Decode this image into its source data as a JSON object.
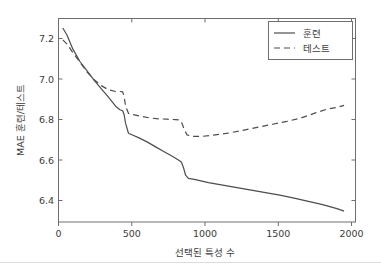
{
  "chart_data": {
    "type": "line",
    "title": "",
    "xlabel": "선택된 특성 수",
    "ylabel": "MAE 훈련/테스트",
    "xlim": [
      0,
      2080
    ],
    "ylim": [
      6.31,
      7.28
    ],
    "grid": false,
    "legend_position": "top-right",
    "xticks": [
      0,
      500,
      1000,
      1500,
      2000
    ],
    "xticklabels": [
      "0",
      "500",
      "1000",
      "1500",
      "2000"
    ],
    "yticks": [
      6.4,
      6.6,
      6.8,
      7.0,
      7.2
    ],
    "yticklabels": [
      "6.4",
      "6.6",
      "6.8",
      "7.0",
      "7.2"
    ],
    "series": [
      {
        "name": "훈련",
        "style": "solid",
        "color": "#4d4d4d",
        "x": [
          30,
          60,
          100,
          150,
          200,
          250,
          300,
          350,
          400,
          430,
          450,
          460,
          470,
          490,
          510,
          560,
          620,
          680,
          740,
          800,
          840,
          860,
          875,
          890,
          910,
          960,
          1050,
          1150,
          1250,
          1350,
          1450,
          1550,
          1650,
          1750,
          1850,
          1950,
          2000
        ],
        "values": [
          7.235,
          7.2,
          7.135,
          7.075,
          7.03,
          6.985,
          6.945,
          6.905,
          6.862,
          6.845,
          6.84,
          6.82,
          6.78,
          6.733,
          6.727,
          6.712,
          6.692,
          6.668,
          6.645,
          6.622,
          6.606,
          6.596,
          6.57,
          6.533,
          6.518,
          6.512,
          6.498,
          6.486,
          6.474,
          6.462,
          6.45,
          6.438,
          6.424,
          6.408,
          6.393,
          6.374,
          6.362
        ]
      },
      {
        "name": "테스트",
        "style": "dashed",
        "color": "#4d4d4d",
        "x": [
          30,
          60,
          100,
          150,
          200,
          250,
          300,
          350,
          400,
          430,
          450,
          460,
          470,
          490,
          520,
          570,
          640,
          700,
          760,
          820,
          850,
          865,
          880,
          900,
          940,
          1000,
          1060,
          1130,
          1200,
          1300,
          1400,
          1500,
          1600,
          1700,
          1800,
          1880,
          1950,
          2000
        ],
        "values": [
          7.178,
          7.158,
          7.118,
          7.072,
          7.025,
          6.988,
          6.96,
          6.94,
          6.932,
          6.932,
          6.93,
          6.905,
          6.862,
          6.828,
          6.822,
          6.815,
          6.806,
          6.802,
          6.8,
          6.798,
          6.796,
          6.78,
          6.752,
          6.725,
          6.718,
          6.718,
          6.722,
          6.728,
          6.735,
          6.748,
          6.762,
          6.776,
          6.79,
          6.806,
          6.83,
          6.848,
          6.856,
          6.866
        ]
      }
    ]
  },
  "legend": {
    "entries": [
      {
        "label": "훈련",
        "style": "solid"
      },
      {
        "label": "테스트",
        "style": "dashed"
      }
    ]
  },
  "figure": {
    "background_color": "#ffffff",
    "axis_color": "#6e6e6e",
    "line_color": "#4d4d4d",
    "text_color": "#3b3b3b",
    "divider_color": "#dcdcdc"
  }
}
